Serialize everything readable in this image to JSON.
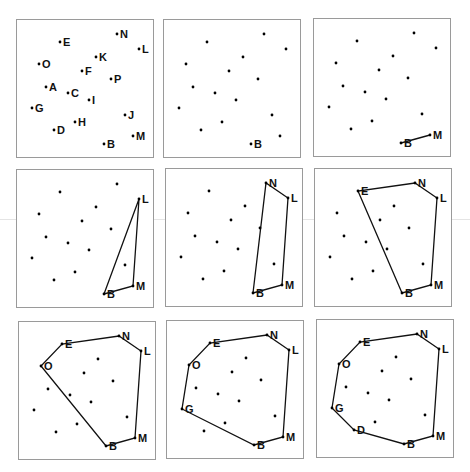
{
  "style": {
    "point_color": "#000000",
    "edge_color": "#111111",
    "frame_color": "#9a9a9a"
  },
  "points": {
    "N": [
      100,
      14
    ],
    "L": [
      122,
      29
    ],
    "E": [
      43,
      22
    ],
    "K": [
      79,
      37
    ],
    "O": [
      22,
      44
    ],
    "F": [
      65,
      51
    ],
    "P": [
      94,
      59
    ],
    "A": [
      29,
      67
    ],
    "C": [
      51,
      73
    ],
    "I": [
      72,
      80
    ],
    "G": [
      15,
      88
    ],
    "J": [
      108,
      95
    ],
    "H": [
      58,
      102
    ],
    "D": [
      37,
      110
    ],
    "M": [
      116,
      116
    ],
    "B": [
      87,
      124
    ]
  },
  "panels": [
    {
      "x": 16,
      "y": 19,
      "labels": [
        "N",
        "L",
        "E",
        "K",
        "O",
        "F",
        "P",
        "A",
        "C",
        "I",
        "G",
        "J",
        "H",
        "D",
        "M",
        "B"
      ],
      "hull": [],
      "closed": false
    },
    {
      "x": 163,
      "y": 19,
      "labels": [
        "B"
      ],
      "hull": [],
      "closed": false
    },
    {
      "x": 313,
      "y": 18,
      "labels": [
        "B",
        "M"
      ],
      "hull": [
        "B",
        "M"
      ],
      "closed": false
    },
    {
      "x": 16,
      "y": 169,
      "labels": [
        "B",
        "M",
        "L"
      ],
      "hull": [
        "B",
        "M",
        "L"
      ],
      "closed": true
    },
    {
      "x": 165,
      "y": 168,
      "labels": [
        "B",
        "M",
        "L",
        "N"
      ],
      "hull": [
        "B",
        "M",
        "L",
        "N"
      ],
      "closed": true
    },
    {
      "x": 314,
      "y": 168,
      "labels": [
        "B",
        "M",
        "L",
        "N",
        "E"
      ],
      "hull": [
        "B",
        "M",
        "L",
        "N",
        "E"
      ],
      "closed": true
    },
    {
      "x": 18,
      "y": 321,
      "labels": [
        "B",
        "M",
        "L",
        "N",
        "E",
        "O"
      ],
      "hull": [
        "B",
        "M",
        "L",
        "N",
        "E",
        "O"
      ],
      "closed": true
    },
    {
      "x": 166,
      "y": 320,
      "labels": [
        "B",
        "M",
        "L",
        "N",
        "E",
        "O",
        "G"
      ],
      "hull": [
        "B",
        "M",
        "L",
        "N",
        "E",
        "O",
        "G"
      ],
      "closed": true
    },
    {
      "x": 316,
      "y": 319,
      "labels": [
        "B",
        "M",
        "L",
        "N",
        "E",
        "O",
        "G",
        "D"
      ],
      "hull": [
        "B",
        "M",
        "L",
        "N",
        "E",
        "O",
        "G",
        "D"
      ],
      "closed": true
    }
  ]
}
